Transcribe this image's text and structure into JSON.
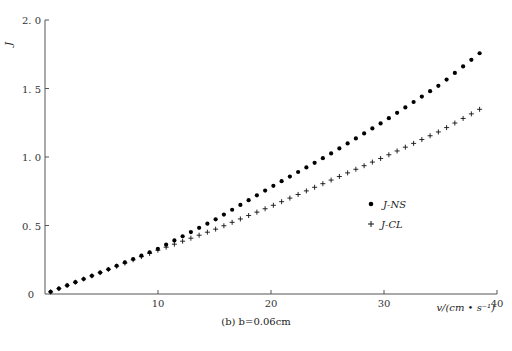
{
  "chart_data": {
    "type": "scatter",
    "title": "",
    "caption": "(b) b=0.06cm",
    "xlabel": "v/(cm • s⁻¹)",
    "ylabel": "J",
    "xlim": [
      0,
      40
    ],
    "ylim": [
      0,
      2.0
    ],
    "x_ticks": [
      0,
      10,
      20,
      30,
      40
    ],
    "y_ticks": [
      0,
      0.5,
      1.0,
      1.5,
      2.0
    ],
    "x_tick_labels": [
      "0",
      "10",
      "20",
      "30",
      "40"
    ],
    "y_tick_labels": [
      "0",
      "0.5",
      "1.0",
      "1.5",
      "2.0"
    ],
    "grid": false,
    "legend_position": "center-right",
    "series": [
      {
        "name": "J-NS",
        "marker": "dot",
        "x_start": 0.5,
        "x_end": 38.5,
        "y_start": 0.016,
        "y_end": 1.76,
        "description": "approximately linear, slope ~0.0457 per cm/s, slight upward curvature"
      },
      {
        "name": "J-CL",
        "marker": "plus",
        "x_start": 0.5,
        "x_end": 38.5,
        "y_start": 0.016,
        "y_end": 1.35,
        "description": "coincides with J-NS up to v≈8, then grows more slowly, slope ~0.035"
      }
    ],
    "sample_points": {
      "x": [
        0.5,
        5,
        10,
        15,
        20,
        25,
        30,
        35,
        38.5
      ],
      "J_NS": [
        0.016,
        0.16,
        0.33,
        0.54,
        0.78,
        1.01,
        1.26,
        1.53,
        1.76
      ],
      "J_CL": [
        0.016,
        0.16,
        0.32,
        0.47,
        0.64,
        0.82,
        1.0,
        1.19,
        1.35
      ]
    }
  }
}
